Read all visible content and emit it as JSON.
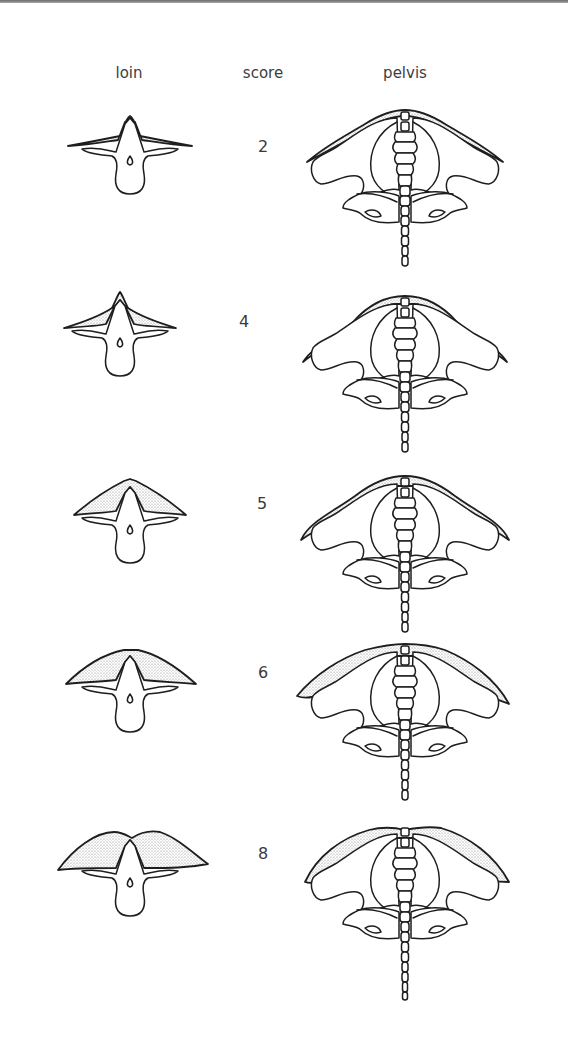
{
  "headers": {
    "loin": "loin",
    "score": "score",
    "pelvis": "pelvis"
  },
  "rows": [
    {
      "score": "2",
      "fat_level": 0.1
    },
    {
      "score": "4",
      "fat_level": 0.35
    },
    {
      "score": "5",
      "fat_level": 0.55
    },
    {
      "score": "6",
      "fat_level": 0.75
    },
    {
      "score": "8",
      "fat_level": 1.0
    }
  ],
  "colors": {
    "line": "#1e1e1e",
    "stipple": "#8a8a8a",
    "text": "#3a3a3a"
  }
}
